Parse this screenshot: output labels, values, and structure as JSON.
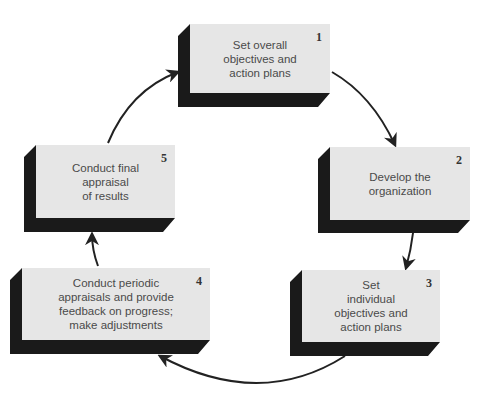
{
  "diagram": {
    "type": "cycle",
    "colors": {
      "face": "#e6e6e6",
      "extrusion": "#1a1a1a",
      "arrow": "#222222",
      "text": "#4a4a4a"
    },
    "steps": [
      {
        "number": "1",
        "label": "Set overall\nobjectives and\naction plans"
      },
      {
        "number": "2",
        "label": "Develop the\norganization"
      },
      {
        "number": "3",
        "label": "Set\nindividual\nobjectives and\naction plans"
      },
      {
        "number": "4",
        "label": "Conduct periodic\nappraisals and provide\nfeedback on progress;\nmake adjustments"
      },
      {
        "number": "5",
        "label": "Conduct final\nappraisal\nof results"
      }
    ],
    "flow": [
      "1→2",
      "2→3",
      "3→4",
      "4→5",
      "5→1"
    ]
  }
}
